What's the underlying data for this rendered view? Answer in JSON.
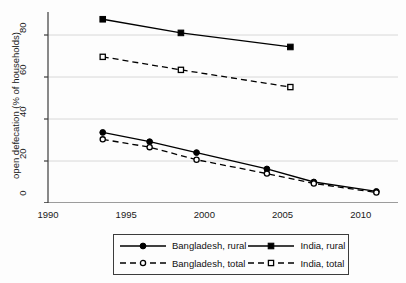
{
  "chart_data": {
    "type": "line",
    "title": "",
    "xlabel": "",
    "ylabel": "open defecation (% of households)",
    "xlim": [
      1990,
      2012
    ],
    "ylim": [
      0,
      90
    ],
    "xticks": [
      1990,
      1995,
      2000,
      2005,
      2010
    ],
    "yticks": [
      0,
      20,
      40,
      60,
      80
    ],
    "grid": "horizontal",
    "legend_position": "below-center",
    "series": [
      {
        "name": "Bangladesh, rural",
        "marker": "filled-circle",
        "line": "solid",
        "color": "#000000",
        "x": [
          1993.5,
          1996.5,
          1999.5,
          2004.0,
          2007.0,
          2011.0
        ],
        "y": [
          33.6,
          29.2,
          24.0,
          16.2,
          10.0,
          5.5
        ]
      },
      {
        "name": "Bangladesh, total",
        "marker": "open-circle",
        "line": "dashed",
        "color": "#000000",
        "x": [
          1993.5,
          1996.5,
          1999.5,
          2004.0,
          2007.0,
          2011.0
        ],
        "y": [
          30.3,
          26.6,
          20.6,
          14.0,
          9.3,
          5.0
        ]
      },
      {
        "name": "India, rural",
        "marker": "filled-square",
        "line": "solid",
        "color": "#000000",
        "x": [
          1993.5,
          1998.5,
          2005.5
        ],
        "y": [
          87.5,
          81.0,
          74.3
        ]
      },
      {
        "name": "India, total",
        "marker": "open-square",
        "line": "dashed",
        "color": "#000000",
        "x": [
          1993.5,
          1998.5,
          2005.5
        ],
        "y": [
          69.6,
          63.4,
          55.2
        ]
      }
    ]
  },
  "axes": {
    "y_title": "open defecation (% of households)",
    "y_tick_labels": [
      "0",
      "20",
      "40",
      "60",
      "80"
    ],
    "x_tick_labels": [
      "1990",
      "1995",
      "2000",
      "2005",
      "2010"
    ]
  },
  "legend": {
    "entries": [
      {
        "label": "Bangladesh, rural",
        "marker": "filled-circle",
        "line": "solid"
      },
      {
        "label": "India, rural",
        "marker": "filled-square",
        "line": "solid"
      },
      {
        "label": "Bangladesh, total",
        "marker": "open-circle",
        "line": "dashed"
      },
      {
        "label": "India, total",
        "marker": "open-square",
        "line": "dashed"
      }
    ]
  },
  "colors": {
    "axis": "#3c3c3c",
    "grid": "#d8d8d8",
    "series": "#000000",
    "background": "#fdfdfd"
  }
}
